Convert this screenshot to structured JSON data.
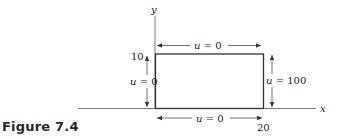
{
  "figure": {
    "caption": "Figure 7.4",
    "axes": {
      "x_label": "x",
      "y_label": "y"
    },
    "ticks": {
      "y_top": "10",
      "x_right": "20"
    },
    "boundary_conditions": {
      "top": {
        "var": "u",
        "eq": " = ",
        "value": "0"
      },
      "bottom": {
        "var": "u",
        "eq": " = ",
        "value": "0"
      },
      "left": {
        "var": "u",
        "eq": " = ",
        "value": "0"
      },
      "right": {
        "var": "u",
        "eq": " = ",
        "value": "100"
      }
    },
    "domain": {
      "x_range": [
        0,
        20
      ],
      "y_range": [
        0,
        10
      ]
    },
    "colors": {
      "line": "#333333",
      "text": "#222222"
    }
  }
}
